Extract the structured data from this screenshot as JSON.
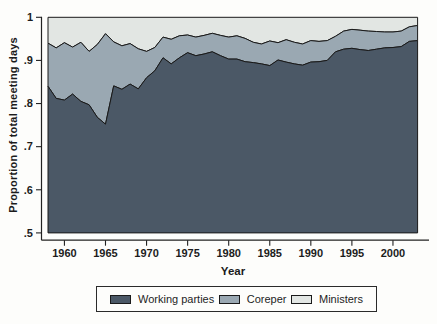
{
  "figure": {
    "y_axis_label": "Proportion of total meeting days",
    "x_axis_label": "Year",
    "y_ticks": [
      {
        "label": "1",
        "value": 1.0
      },
      {
        "label": ".9",
        "value": 0.9
      },
      {
        "label": ".8",
        "value": 0.8
      },
      {
        "label": ".7",
        "value": 0.7
      },
      {
        "label": ".6",
        "value": 0.6
      },
      {
        "label": ".5",
        "value": 0.5
      }
    ],
    "x_ticks": [
      {
        "label": "1960",
        "value": 1960
      },
      {
        "label": "1965",
        "value": 1965
      },
      {
        "label": "1970",
        "value": 1970
      },
      {
        "label": "1975",
        "value": 1975
      },
      {
        "label": "1980",
        "value": 1980
      },
      {
        "label": "1985",
        "value": 1985
      },
      {
        "label": "1990",
        "value": 1990
      },
      {
        "label": "1995",
        "value": 1995
      },
      {
        "label": "2000",
        "value": 2000
      }
    ],
    "legend": [
      {
        "label": "Working parties",
        "color": "#4b5866"
      },
      {
        "label": "Coreper",
        "color": "#9aa8b2"
      },
      {
        "label": "Ministers",
        "color": "#e2e6e3"
      }
    ]
  },
  "chart_data": {
    "type": "area",
    "stacked": true,
    "stacking_note": "values are cumulative stacked proportions (upper boundary of each band); Ministers band extends to 1.0",
    "title": "",
    "xlabel": "Year",
    "ylabel": "Proportion of total meeting days",
    "x_range": [
      1958,
      2003
    ],
    "ylim": [
      0.5,
      1.0
    ],
    "legend_position": "bottom",
    "outline_color": "#1a1a1a",
    "years": [
      1958,
      1959,
      1960,
      1961,
      1962,
      1963,
      1964,
      1965,
      1966,
      1967,
      1968,
      1969,
      1970,
      1971,
      1972,
      1973,
      1974,
      1975,
      1976,
      1977,
      1978,
      1979,
      1980,
      1981,
      1982,
      1983,
      1984,
      1985,
      1986,
      1987,
      1988,
      1989,
      1990,
      1991,
      1992,
      1993,
      1994,
      1995,
      1996,
      1997,
      1998,
      1999,
      2000,
      2001,
      2002,
      2003
    ],
    "series": [
      {
        "name": "Working parties",
        "color": "#4b5866",
        "cumulative_upper": [
          0.84,
          0.812,
          0.808,
          0.822,
          0.805,
          0.797,
          0.768,
          0.752,
          0.841,
          0.833,
          0.845,
          0.834,
          0.86,
          0.876,
          0.906,
          0.892,
          0.906,
          0.918,
          0.911,
          0.915,
          0.92,
          0.911,
          0.903,
          0.903,
          0.897,
          0.895,
          0.892,
          0.888,
          0.901,
          0.896,
          0.892,
          0.889,
          0.896,
          0.897,
          0.9,
          0.92,
          0.926,
          0.928,
          0.925,
          0.923,
          0.926,
          0.929,
          0.93,
          0.932,
          0.944,
          0.946
        ]
      },
      {
        "name": "Coreper",
        "color": "#9aa8b2",
        "cumulative_upper": [
          0.94,
          0.929,
          0.941,
          0.931,
          0.942,
          0.921,
          0.937,
          0.962,
          0.943,
          0.934,
          0.939,
          0.927,
          0.921,
          0.93,
          0.954,
          0.949,
          0.957,
          0.959,
          0.954,
          0.958,
          0.963,
          0.958,
          0.954,
          0.957,
          0.951,
          0.942,
          0.938,
          0.945,
          0.941,
          0.948,
          0.942,
          0.938,
          0.946,
          0.944,
          0.946,
          0.956,
          0.968,
          0.972,
          0.97,
          0.968,
          0.967,
          0.966,
          0.966,
          0.968,
          0.978,
          0.981
        ]
      },
      {
        "name": "Ministers",
        "color": "#e2e6e3",
        "cumulative_upper_constant": 1.0
      }
    ]
  }
}
